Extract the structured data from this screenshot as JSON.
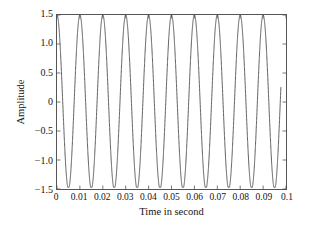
{
  "chart_data": {
    "type": "line",
    "title": "",
    "xlabel": "Time in second",
    "ylabel": "Amplitude",
    "xlim": [
      0,
      0.1
    ],
    "ylim": [
      -1.5,
      1.5
    ],
    "grid": false,
    "legend": null,
    "line_color": "#4a4a4a",
    "frame_color": "#555555",
    "background_color": "#ffffff",
    "xticks": [
      "0",
      "0.01",
      "0.02",
      "0.03",
      "0.04",
      "0.05",
      "0.06",
      "0.07",
      "0.08",
      "0.09",
      "0.1"
    ],
    "xtick_values": [
      0,
      0.01,
      0.02,
      0.03,
      0.04,
      0.05,
      0.06,
      0.07,
      0.08,
      0.09,
      0.1
    ],
    "yticks": [
      "1.5",
      "1.0",
      "0.5",
      "0",
      "−0.5",
      "−1.0",
      "−1.5"
    ],
    "ytick_values": [
      1.5,
      1.0,
      0.5,
      0,
      -0.5,
      -1.0,
      -1.5
    ],
    "series": [
      {
        "name": "signal",
        "waveform": "cosine",
        "amplitude": 1.5,
        "frequency_hz": 100,
        "phase_rad": 0,
        "cycles_visible": 10,
        "peak_value": 1.5,
        "trough_value": -1.47,
        "start_value": 1.5,
        "end_value": 0.25,
        "x": [
          0,
          0.0025,
          0.005,
          0.0075,
          0.01,
          0.0125,
          0.015,
          0.0175,
          0.02,
          0.0225,
          0.025,
          0.0275,
          0.03,
          0.0325,
          0.035,
          0.0375,
          0.04,
          0.0425,
          0.045,
          0.0475,
          0.05,
          0.0525,
          0.055,
          0.0575,
          0.06,
          0.0625,
          0.065,
          0.0675,
          0.07,
          0.0725,
          0.075,
          0.0775,
          0.08,
          0.0825,
          0.085,
          0.0875,
          0.09,
          0.0925,
          0.095,
          0.0975,
          0.1
        ],
        "y": [
          1.5,
          0,
          -1.5,
          0,
          1.5,
          0,
          -1.5,
          0,
          1.5,
          0,
          -1.5,
          0,
          1.5,
          0,
          -1.5,
          0,
          1.5,
          0,
          -1.5,
          0,
          1.5,
          0,
          -1.5,
          0,
          1.5,
          0,
          -1.5,
          0,
          1.5,
          0,
          -1.5,
          0,
          1.5,
          0,
          -1.5,
          0,
          1.5,
          0,
          -1.5,
          0,
          0.25
        ]
      }
    ]
  },
  "axes": {
    "ylabel": "Amplitude",
    "xlabel": "Time in second"
  }
}
